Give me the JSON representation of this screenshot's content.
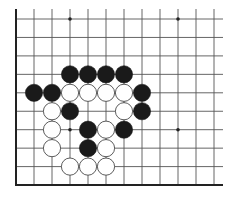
{
  "diagram": {
    "type": "go-board-fragment",
    "corner": "bottom-left",
    "columns": 12,
    "rows": 10,
    "colors": {
      "background": "#ffffff",
      "line": "#555555",
      "border": "#222222",
      "black_stone": "#1a1a1a",
      "white_stone": "#ffffff",
      "white_stone_edge": "#333333"
    },
    "star_points": [
      {
        "col": 3,
        "row": 0
      },
      {
        "col": 9,
        "row": 0
      },
      {
        "col": 3,
        "row": 6
      },
      {
        "col": 9,
        "row": 6
      }
    ],
    "stones": [
      {
        "color": "black",
        "col": 3,
        "row": 3
      },
      {
        "color": "black",
        "col": 4,
        "row": 3
      },
      {
        "color": "black",
        "col": 5,
        "row": 3
      },
      {
        "color": "black",
        "col": 6,
        "row": 3
      },
      {
        "color": "black",
        "col": 1,
        "row": 4
      },
      {
        "color": "black",
        "col": 2,
        "row": 4
      },
      {
        "color": "white",
        "col": 3,
        "row": 4
      },
      {
        "color": "white",
        "col": 4,
        "row": 4
      },
      {
        "color": "white",
        "col": 5,
        "row": 4
      },
      {
        "color": "white",
        "col": 6,
        "row": 4
      },
      {
        "color": "black",
        "col": 7,
        "row": 4
      },
      {
        "color": "white",
        "col": 2,
        "row": 5
      },
      {
        "color": "black",
        "col": 3,
        "row": 5
      },
      {
        "color": "white",
        "col": 6,
        "row": 5
      },
      {
        "color": "black",
        "col": 7,
        "row": 5
      },
      {
        "color": "white",
        "col": 2,
        "row": 6
      },
      {
        "color": "black",
        "col": 4,
        "row": 6
      },
      {
        "color": "white",
        "col": 5,
        "row": 6
      },
      {
        "color": "black",
        "col": 6,
        "row": 6
      },
      {
        "color": "white",
        "col": 2,
        "row": 7
      },
      {
        "color": "black",
        "col": 4,
        "row": 7
      },
      {
        "color": "white",
        "col": 5,
        "row": 7
      },
      {
        "color": "white",
        "col": 3,
        "row": 8
      },
      {
        "color": "white",
        "col": 4,
        "row": 8
      },
      {
        "color": "white",
        "col": 5,
        "row": 8
      }
    ]
  }
}
